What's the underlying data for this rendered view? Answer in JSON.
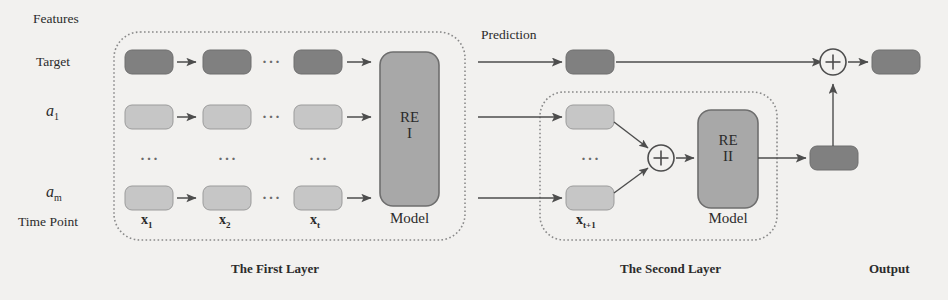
{
  "diagram": {
    "colors": {
      "background": "#f2f1ef",
      "dark_box": "#808080",
      "light_box": "#c6c6c6",
      "model_box": "#a8a8a8",
      "stroke": "#555555",
      "dashed_border": "#8a8a8a",
      "text": "#2b2b2b"
    },
    "axis_labels": {
      "features": "Features",
      "target": "Target",
      "feature_first": "a",
      "feature_first_sub": "1",
      "feature_last": "a",
      "feature_last_sub": "m",
      "time_point": "Time Point"
    },
    "time_ticks": [
      {
        "base": "x",
        "sub": "1"
      },
      {
        "base": "x",
        "sub": "2"
      },
      {
        "base": "x",
        "sub": "t"
      }
    ],
    "second_layer_tick": {
      "base": "x",
      "sub": "t+1"
    },
    "ellipsis": "···",
    "layer_one": {
      "caption": "The First Layer",
      "model_line1": "RE",
      "model_line2": "I",
      "model_caption": "Model"
    },
    "layer_two": {
      "caption": "The Second Layer",
      "model_line1": "RE",
      "model_line2": "II",
      "model_caption": "Model"
    },
    "prediction_label": "Prediction",
    "output": {
      "caption": "Output"
    },
    "operators": {
      "sum_symbol": "+"
    }
  }
}
